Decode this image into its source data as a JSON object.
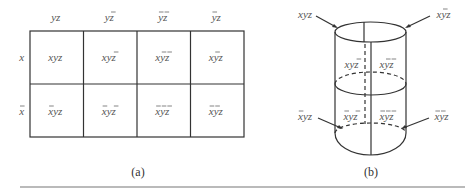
{
  "figure_a": {
    "caption": "(a)",
    "column_headers": [
      {
        "text": "yz",
        "bars": []
      },
      {
        "text": "yz",
        "bars": [
          "z"
        ]
      },
      {
        "text": "yz",
        "bars": [
          "y",
          "z"
        ]
      },
      {
        "text": "yz",
        "bars": [
          "y"
        ]
      }
    ],
    "row_headers": [
      {
        "text": "x",
        "bars": []
      },
      {
        "text": "x",
        "bars": [
          "x"
        ]
      }
    ],
    "cells": [
      [
        {
          "text": "xyz",
          "bars": []
        },
        {
          "text": "xyz",
          "bars": [
            "z"
          ]
        },
        {
          "text": "xyz",
          "bars": [
            "y",
            "z"
          ]
        },
        {
          "text": "xyz",
          "bars": [
            "y"
          ]
        }
      ],
      [
        {
          "text": "xyz",
          "bars": [
            "x"
          ]
        },
        {
          "text": "xyz",
          "bars": [
            "x",
            "z"
          ]
        },
        {
          "text": "xyz",
          "bars": [
            "x",
            "y",
            "z"
          ]
        },
        {
          "text": "xyz",
          "bars": [
            "x",
            "y"
          ]
        }
      ]
    ]
  },
  "figure_b": {
    "caption": "(b)",
    "labels": {
      "top_left": {
        "text": "xyz",
        "bars": []
      },
      "top_right": {
        "text": "xyz",
        "bars": [
          "y"
        ]
      },
      "upper_inner_left": {
        "text": "xyz",
        "bars": [
          "z"
        ]
      },
      "upper_inner_right": {
        "text": "xyz",
        "bars": [
          "y",
          "z"
        ]
      },
      "lower_inner_left": {
        "text": "xyz",
        "bars": [
          "x",
          "z"
        ]
      },
      "lower_inner_right": {
        "text": "xyz",
        "bars": [
          "x",
          "y",
          "z"
        ]
      },
      "bottom_left": {
        "text": "xyz",
        "bars": [
          "x"
        ]
      },
      "bottom_right": {
        "text": "xyz",
        "bars": [
          "x",
          "y"
        ]
      }
    }
  },
  "colors": {
    "line": "#333333",
    "text": "#555555",
    "background": "#ffffff"
  }
}
